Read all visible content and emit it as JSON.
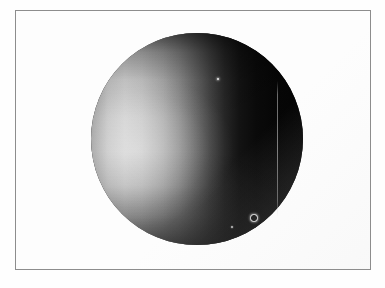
{
  "figure": {
    "kind": "astronomical-photograph",
    "caption": "",
    "background_color": "#ffffff",
    "frame": {
      "border_color": "#8d8d8d",
      "fill_color": "#fdfdfd",
      "x": 15,
      "y": 10,
      "width": 356,
      "height": 260
    },
    "disk": {
      "label": "planet-disk",
      "center_x": 196,
      "center_y": 138,
      "radius_px": 106,
      "illumination": "left-limb crescent, terminator near center",
      "bright_color": "#cfcfcf",
      "shadow_color": "#050505",
      "highlight_center": "21% 55%"
    },
    "streak": {
      "label": "vertical-ring-edge",
      "x": 276,
      "y_start": 80,
      "y_end": 216,
      "color": "#c3c3c3"
    },
    "points": [
      {
        "label": "moon-upper",
        "x": 217,
        "y": 78,
        "diameter_px": 2.6,
        "style": "solid",
        "color": "#efefef"
      },
      {
        "label": "moon-ringed",
        "x": 252,
        "y": 216,
        "diameter_px": 5.2,
        "style": "ring",
        "color": "#f2f2f2"
      },
      {
        "label": "moon-lower",
        "x": 231,
        "y": 226,
        "diameter_px": 2.2,
        "style": "faint",
        "color": "#b8b8b8"
      }
    ]
  }
}
